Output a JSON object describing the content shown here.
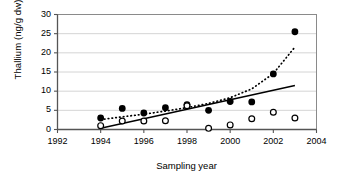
{
  "chart_data": {
    "type": "scatter",
    "title": "",
    "xlabel": "Sampling year",
    "ylabel": "Thallium (ng/g dw)",
    "xlim": [
      1992,
      2004
    ],
    "ylim": [
      0,
      30
    ],
    "xticks": [
      1992,
      1994,
      1996,
      1998,
      2000,
      2002,
      2004
    ],
    "yticks": [
      0,
      5,
      10,
      15,
      20,
      25,
      30
    ],
    "xtick_labels": [
      "1992",
      "1994",
      "1996",
      "1998",
      "2000",
      "2002",
      "2004"
    ],
    "ytick_labels": [
      "0",
      "5",
      "10",
      "15",
      "20",
      "25",
      "30"
    ],
    "grid": "horizontal",
    "legend": "none",
    "series": [
      {
        "name": "filled-circles",
        "marker": "filled-circle",
        "color": "#000000",
        "x": [
          1994,
          1995,
          1996,
          1997,
          1998,
          1999,
          2000,
          2001,
          2002,
          2003
        ],
        "values": [
          3.0,
          5.5,
          4.3,
          5.7,
          6.5,
          5.0,
          7.3,
          7.2,
          14.5,
          25.5
        ]
      },
      {
        "name": "open-circles",
        "marker": "open-circle",
        "color": "#000000",
        "x": [
          1994,
          1995,
          1996,
          1997,
          1998,
          1999,
          2000,
          2001,
          2002,
          2003
        ],
        "values": [
          1.0,
          2.2,
          2.2,
          2.3,
          6.2,
          0.3,
          1.2,
          2.8,
          4.5,
          3.0
        ]
      }
    ],
    "trendlines": [
      {
        "name": "dotted-trend-curve",
        "style": "dotted",
        "color": "#000000",
        "x": [
          1994,
          1995,
          1996,
          1997,
          1998,
          1999,
          2000,
          2001,
          2002,
          2003
        ],
        "values": [
          2.6,
          3.3,
          4.0,
          4.8,
          5.7,
          6.8,
          8.3,
          10.6,
          14.6,
          21.5
        ]
      },
      {
        "name": "solid-trend-line",
        "style": "solid",
        "color": "#000000",
        "x": [
          1994,
          2003
        ],
        "values": [
          0.3,
          11.5
        ]
      }
    ]
  }
}
